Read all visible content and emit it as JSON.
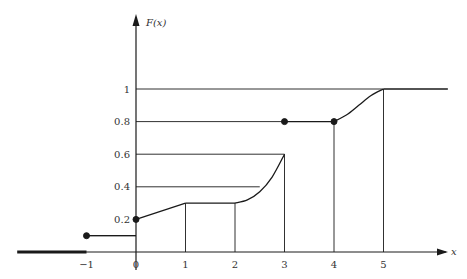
{
  "chart_data": {
    "type": "line",
    "title": "",
    "xlabel": "x",
    "ylabel": "F(x)",
    "xlim": [
      -2.4,
      6.3
    ],
    "ylim": [
      0,
      1.15
    ],
    "grid": false,
    "x_ticks": [
      -1,
      0,
      1,
      2,
      3,
      4,
      5
    ],
    "x_tick_labels": [
      "−1",
      "0",
      "1",
      "2",
      "3",
      "4",
      "5"
    ],
    "y_ticks": [
      0.2,
      0.4,
      0.6,
      0.8,
      1
    ],
    "y_tick_labels": [
      "0.2",
      "0.4",
      "0.6",
      "0.8",
      "1"
    ],
    "segments": [
      {
        "name": "zero-region",
        "points": [
          [
            -2.4,
            0
          ],
          [
            -1,
            0
          ]
        ],
        "thick": true
      },
      {
        "name": "flat-0.1",
        "points": [
          [
            -1,
            0.1
          ],
          [
            0,
            0.1
          ]
        ]
      },
      {
        "name": "linear-rise",
        "points": [
          [
            0,
            0.2
          ],
          [
            1,
            0.3
          ]
        ]
      },
      {
        "name": "flat-0.3",
        "points": [
          [
            1,
            0.3
          ],
          [
            2,
            0.3
          ]
        ]
      },
      {
        "name": "convex-rise",
        "points": [
          [
            2,
            0.3
          ],
          [
            2.25,
            0.32
          ],
          [
            2.5,
            0.37
          ],
          [
            2.75,
            0.46
          ],
          [
            3,
            0.6
          ]
        ],
        "curve": true
      },
      {
        "name": "flat-0.8",
        "points": [
          [
            3,
            0.8
          ],
          [
            4,
            0.8
          ]
        ]
      },
      {
        "name": "s-rise",
        "points": [
          [
            4,
            0.8
          ],
          [
            4.25,
            0.84
          ],
          [
            4.5,
            0.9
          ],
          [
            4.75,
            0.96
          ],
          [
            5,
            1
          ]
        ],
        "curve": true
      },
      {
        "name": "flat-1",
        "points": [
          [
            5,
            1
          ],
          [
            6.3,
            1
          ]
        ]
      }
    ],
    "points": [
      {
        "x": -1,
        "y": 0.1,
        "filled": true
      },
      {
        "x": 0,
        "y": 0.2,
        "filled": true
      },
      {
        "x": 3,
        "y": 0.8,
        "filled": true
      },
      {
        "x": 4,
        "y": 0.8,
        "filled": true
      }
    ],
    "guide_lines": {
      "horizontal": [
        {
          "y": 0.1,
          "x_from": 0,
          "x_to": -1
        },
        {
          "y": 0.4,
          "x_from": 0,
          "x_to": 2.5
        },
        {
          "y": 0.6,
          "x_from": 0,
          "x_to": 3
        },
        {
          "y": 0.8,
          "x_from": 0,
          "x_to": 3
        },
        {
          "y": 1,
          "x_from": 0,
          "x_to": 5
        }
      ],
      "vertical": [
        {
          "x": 1,
          "y_to": 0.3
        },
        {
          "x": 2,
          "y_to": 0.3
        },
        {
          "x": 3,
          "y_to": 0.6
        },
        {
          "x": 4,
          "y_to": 0.8
        },
        {
          "x": 5,
          "y_to": 1
        }
      ]
    }
  }
}
